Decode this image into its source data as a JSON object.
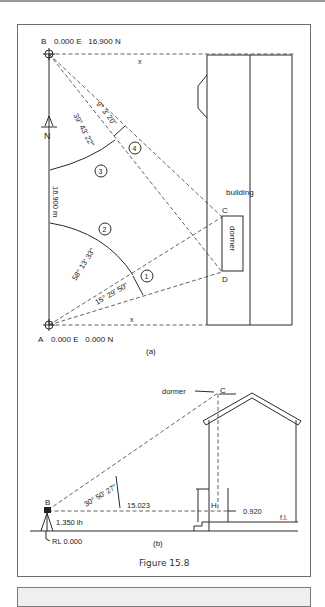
{
  "figure": {
    "caption": "Figure 15.8",
    "panel_a": {
      "label": "(a)",
      "station_B": {
        "name": "B",
        "coords": "0.000 E   16.900 N"
      },
      "station_A": {
        "name": "A",
        "coords": "0.000 E   0.000 N"
      },
      "north_label": "N",
      "baseline_length": "16.900 m",
      "x_marks": [
        "x",
        "x"
      ],
      "building_label": "building",
      "dormer_label": "dormer",
      "point_C": "C",
      "point_D": "D",
      "angles": [
        {
          "id": "1",
          "value": "15° 29' 50\""
        },
        {
          "id": "2",
          "value": "58° 13' 33\""
        },
        {
          "id": "3",
          "value": "39° 43' 22\""
        },
        {
          "id": "4",
          "value": "9° 3' 20\""
        }
      ]
    },
    "panel_b": {
      "label": "(b)",
      "instrument": "B",
      "vertical_angle": "30° 50' 27\"",
      "horizontal_distance": "15.023",
      "instrument_height": "1.350 ih",
      "reduced_level": "RL 0.000",
      "dormer_label": "dormer",
      "point_C": "C",
      "point_H": "H",
      "staff_reading": "0.920",
      "floor_level": "f.l."
    }
  }
}
